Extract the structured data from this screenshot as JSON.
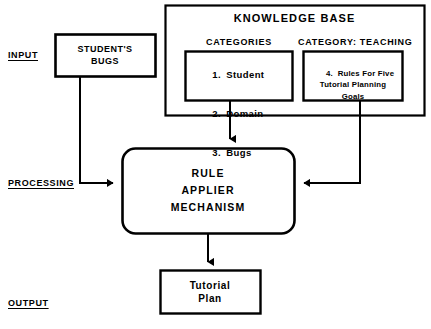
{
  "diagram": {
    "stages": [
      {
        "id": "input",
        "label": "INPUT"
      },
      {
        "id": "processing",
        "label": "PROCESSING"
      },
      {
        "id": "output",
        "label": "OUTPUT"
      }
    ],
    "knowledge_base": {
      "title": "KNOWLEDGE BASE",
      "columns": [
        {
          "id": "categories",
          "header": "CATEGORIES",
          "items": [
            {
              "number": "1.",
              "label": "Student"
            },
            {
              "number": "2.",
              "label": "Domain"
            },
            {
              "number": "3.",
              "label": "Bugs"
            }
          ]
        },
        {
          "id": "category-teaching",
          "header": "CATEGORY: TEACHING",
          "items": [
            {
              "number": "4.",
              "label": "Rules For Five\nTutorial Planning\nGoals"
            }
          ]
        }
      ]
    },
    "nodes": [
      {
        "id": "students-bugs",
        "label": "STUDENT'S\nBUGS",
        "shape": "rect"
      },
      {
        "id": "rule-applier",
        "label": "RULE\nAPPLIER\nMECHANISM",
        "shape": "rounded-rect"
      },
      {
        "id": "tutorial-plan",
        "label": "Tutorial\nPlan",
        "shape": "rect"
      }
    ],
    "edges": [
      {
        "id": "bugs-to-rule",
        "from": "students-bugs",
        "to": "rule-applier",
        "arrow": "right"
      },
      {
        "id": "categories-to-rule",
        "from": "categories",
        "to": "rule-applier",
        "arrow": "down"
      },
      {
        "id": "teaching-to-rule",
        "from": "category-teaching",
        "to": "rule-applier",
        "arrow": "left"
      },
      {
        "id": "rule-to-plan",
        "from": "rule-applier",
        "to": "tutorial-plan",
        "arrow": "down"
      }
    ],
    "colors": {
      "background": "#ffffff",
      "stroke": "#000000",
      "text": "#000000"
    }
  }
}
